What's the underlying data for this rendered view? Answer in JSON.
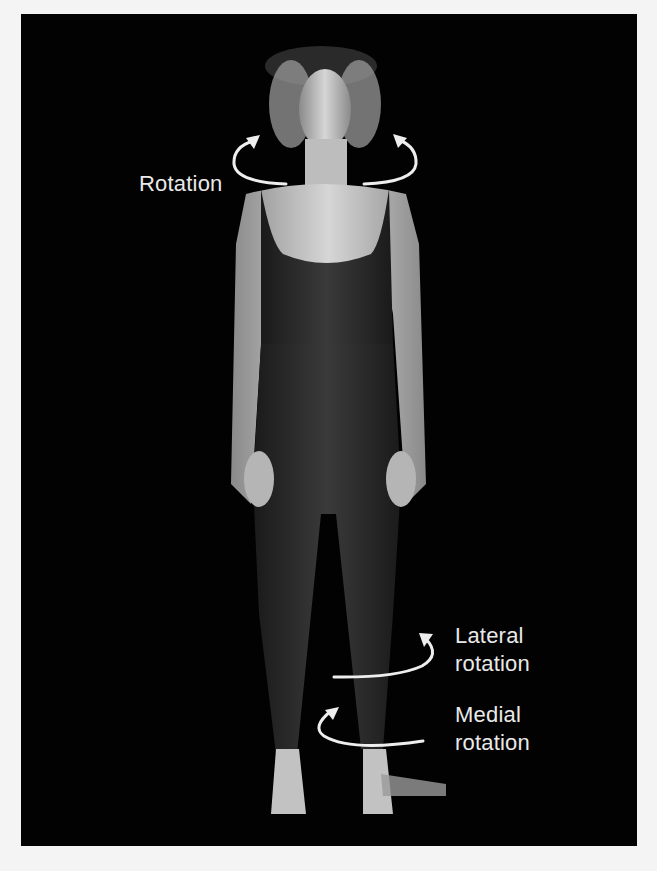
{
  "figure": {
    "background_color": "#020202",
    "labels": {
      "neck": "Rotation",
      "hip_lateral_line1": "Lateral",
      "hip_lateral_line2": "rotation",
      "hip_medial_line1": "Medial",
      "hip_medial_line2": "rotation"
    },
    "arrows": [
      "neck-rotation-left-arrow",
      "neck-rotation-right-arrow",
      "lateral-rotation-arrow",
      "medial-rotation-arrow"
    ]
  }
}
